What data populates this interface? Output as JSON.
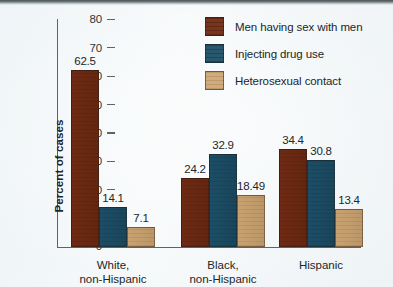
{
  "chart_data": {
    "type": "bar",
    "title": "",
    "xlabel": "",
    "ylabel": "Percent of cases",
    "ylim": [
      0,
      80
    ],
    "yticks": [
      0,
      10,
      20,
      30,
      40,
      50,
      60,
      70,
      80
    ],
    "ytick_labels": [
      "0",
      "10",
      "20",
      "30",
      "40",
      "50",
      "60",
      "70",
      "80"
    ],
    "grid": false,
    "legend_position": "top-right",
    "categories": [
      "White,\nnon-Hispanic",
      "Black,\nnon-Hispanic",
      "Hispanic"
    ],
    "series": [
      {
        "name": "Men having sex with men",
        "color": "#6e2b14",
        "values": [
          62.5,
          24.2,
          34.4
        ],
        "value_labels": [
          "62.5",
          "24.2",
          "34.4"
        ]
      },
      {
        "name": "Injecting drug use",
        "color": "#1d4e66",
        "values": [
          14.1,
          32.9,
          30.8
        ],
        "value_labels": [
          "14.1",
          "32.9",
          "30.8"
        ]
      },
      {
        "name": "Heterosexual contact",
        "color": "#c9a270",
        "values": [
          7.1,
          18.49,
          13.4
        ],
        "value_labels": [
          "7.1",
          "18.49",
          "13.4"
        ]
      }
    ]
  },
  "legend": {
    "items": [
      {
        "label": "Men having sex with men",
        "color": "#6e2b14"
      },
      {
        "label": "Injecting drug use",
        "color": "#1d4e66"
      },
      {
        "label": "Heterosexual contact",
        "color": "#c9a270"
      }
    ]
  },
  "axes": {
    "y_title": "Percent of cases",
    "y_tick_labels": [
      "80",
      "70",
      "60",
      "50",
      "40",
      "30",
      "20",
      "10",
      "0"
    ],
    "x_tick_labels": [
      "White,\nnon-Hispanic",
      "Black,\nnon-Hispanic",
      "Hispanic"
    ]
  }
}
